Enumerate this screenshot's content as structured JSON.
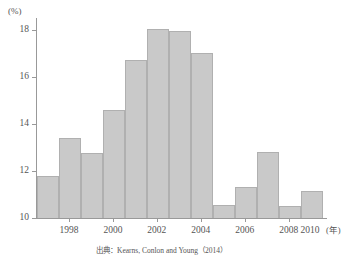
{
  "chart_data": {
    "type": "bar",
    "title": "",
    "subtitle": "",
    "xlabel": "年",
    "ylabel": "(%)",
    "yunit": "(%)",
    "xunit": "(年)",
    "categories": [
      1997,
      1998,
      1999,
      2000,
      2001,
      2002,
      2003,
      2004,
      2005,
      2006,
      2007,
      2008,
      2009
    ],
    "values": [
      11.8,
      13.4,
      12.75,
      14.6,
      16.7,
      18.05,
      17.95,
      17.0,
      10.55,
      11.3,
      12.8,
      10.5,
      11.15
    ],
    "ylim": [
      10,
      18.5
    ],
    "yticks": [
      10,
      12,
      14,
      16,
      18
    ],
    "ytick_labels": [
      "10",
      "12",
      "14",
      "16",
      "18"
    ],
    "xticks": [
      1998,
      2000,
      2002,
      2004,
      2006,
      2008,
      2010
    ],
    "xtick_labels": [
      "1998",
      "2000",
      "2002",
      "2004",
      "2006",
      "2008",
      "2010"
    ],
    "grid": false,
    "legend": null,
    "bar_color": "#c9c9c9",
    "bar_border_color": "#b0b0b0",
    "axis_color": "#999999",
    "text_color": "#555555",
    "background": "#ffffff"
  },
  "source_note": "出典：Kearns, Conlon and Young（2014）"
}
